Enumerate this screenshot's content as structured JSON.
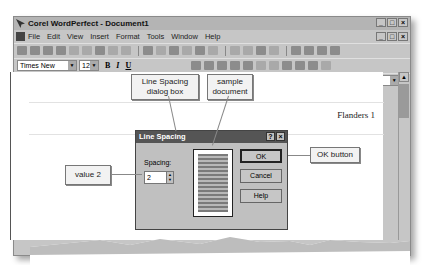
{
  "window": {
    "title": "Corel WordPerfect - Document1",
    "controls": [
      "_",
      "□",
      "×"
    ]
  },
  "menubar": {
    "items": [
      "File",
      "Edit",
      "View",
      "Insert",
      "Format",
      "Tools",
      "Window",
      "Help"
    ]
  },
  "property_bar": {
    "font": "Times New Roman",
    "size": "12",
    "bold": "B",
    "italic": "I",
    "underline": "U"
  },
  "document": {
    "header_text": "Flanders 1"
  },
  "dialog": {
    "title": "Line Spacing",
    "help_glyph": "?",
    "close_glyph": "×",
    "spacing_label": "Spacing:",
    "spacing_value": "2",
    "buttons": {
      "ok": "OK",
      "cancel": "Cancel",
      "help": "Help"
    }
  },
  "callouts": {
    "dialog_box": "Line Spacing dialog box",
    "sample": "sample document",
    "ok_button": "OK button",
    "value": "value 2"
  },
  "scroll": {
    "up": "▲"
  },
  "dropdown_glyph": "▼"
}
